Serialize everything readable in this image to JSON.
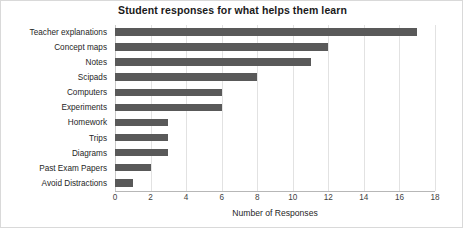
{
  "chart_data": {
    "type": "bar",
    "orientation": "horizontal",
    "title": "Student responses for what helps them learn",
    "xlabel": "Number of Responses",
    "ylabel": "",
    "categories": [
      "Teacher explanations",
      "Concept maps",
      "Notes",
      "Scipads",
      "Computers",
      "Experiments",
      "Homework",
      "Trips",
      "Diagrams",
      "Past Exam Papers",
      "Avoid Distractions"
    ],
    "values": [
      17,
      12,
      11,
      8,
      6,
      6,
      3,
      3,
      3,
      2,
      1
    ],
    "xlim": [
      0,
      18
    ],
    "xticks": [
      0,
      2,
      4,
      6,
      8,
      10,
      12,
      14,
      16,
      18
    ],
    "xtick_labels": [
      "0",
      "2",
      "4",
      "6",
      "8",
      "10",
      "12",
      "14",
      "16",
      "18"
    ],
    "grid": "vertical",
    "legend": "none",
    "bar_color": "#595959",
    "gridline_color": "#e2e2e2",
    "background_color": "#ffffff",
    "border_color": "#d9d9d9"
  }
}
